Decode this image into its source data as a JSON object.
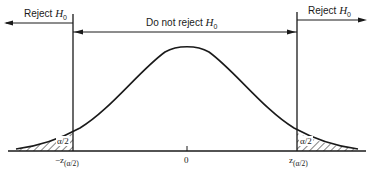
{
  "diagram": {
    "type": "two-tailed hypothesis test, normal distribution",
    "regions": {
      "left_reject": {
        "label": "Reject",
        "symbol": "H",
        "subscript": "0"
      },
      "accept": {
        "label": "Do not reject",
        "symbol": "H",
        "subscript": "0"
      },
      "right_reject": {
        "label": "Reject",
        "symbol": "H",
        "subscript": "0"
      }
    },
    "tail_area_label": "α/2",
    "axis_ticks": {
      "left": "−z",
      "left_sub": "(α/2)",
      "center": "0",
      "right": "z",
      "right_sub": "(α/2)"
    },
    "colors": {
      "ink": "#1a1a1a",
      "background": "#ffffff"
    }
  }
}
